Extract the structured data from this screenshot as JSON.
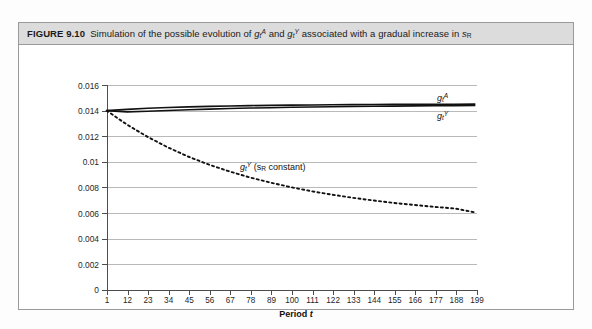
{
  "figure": {
    "label": "FIGURE 9.10",
    "caption_parts": {
      "before_a": "Simulation of the possible evolution of ",
      "g": "g",
      "t": "t",
      "supA": "A",
      "and": " and ",
      "supY": "Y",
      "after": " associated with a gradual increase in ",
      "s": "s",
      "subR": "R"
    },
    "caption_full": "Simulation of the possible evolution of g t A and g t Y associated with a gradual increase in s R"
  },
  "axes": {
    "y_ticks": [
      "0",
      "0.002",
      "0.004",
      "0.006",
      "0.008",
      "0.01",
      "0.012",
      "0.014",
      "0.016"
    ],
    "y_min": 0,
    "y_max": 0.016,
    "x_ticks": [
      "1",
      "12",
      "23",
      "34",
      "45",
      "56",
      "67",
      "78",
      "89",
      "100",
      "111",
      "122",
      "133",
      "144",
      "155",
      "166",
      "177",
      "188",
      "199"
    ],
    "x_min": 1,
    "x_max": 199,
    "x_title_text": "Period ",
    "x_title_var": "t"
  },
  "series_labels": {
    "ga": {
      "g": "g",
      "sub": "t",
      "sup": "A"
    },
    "gy": {
      "g": "g",
      "sub": "t",
      "sup": "Y"
    },
    "gy_const": {
      "g": "g",
      "sub": "t",
      "sup": "Y",
      "paren_open": " (s",
      "subR": "R",
      "paren_close": " constant)"
    }
  },
  "colors": {
    "caption_bar": "#dcdcdc",
    "border": "#9a9a9a",
    "axis": "#4d4d4d",
    "grid": "#b9b9b9",
    "curve": "#111111"
  },
  "chart_data": {
    "type": "line",
    "xlabel": "Period t",
    "ylabel": "",
    "xlim": [
      1,
      199
    ],
    "ylim": [
      0,
      0.016
    ],
    "grid": true,
    "legend": "inline-annotations",
    "x": [
      1,
      12,
      23,
      34,
      45,
      56,
      67,
      78,
      89,
      100,
      111,
      122,
      133,
      144,
      155,
      166,
      177,
      188,
      199
    ],
    "series": [
      {
        "name": "g_t^A",
        "style": "solid",
        "label_position": "right-top",
        "values": [
          0.014,
          0.0141,
          0.01418,
          0.01424,
          0.01429,
          0.01433,
          0.01436,
          0.01439,
          0.01441,
          0.01443,
          0.01444,
          0.01446,
          0.01447,
          0.01448,
          0.01449,
          0.01449,
          0.0145,
          0.0145,
          0.01451
        ]
      },
      {
        "name": "g_t^Y",
        "style": "solid",
        "label_position": "right-below",
        "values": [
          0.014,
          0.0139,
          0.01395,
          0.01401,
          0.01407,
          0.01412,
          0.01416,
          0.0142,
          0.01423,
          0.01426,
          0.01428,
          0.0143,
          0.01432,
          0.01434,
          0.01435,
          0.01437,
          0.01438,
          0.01439,
          0.0144
        ]
      },
      {
        "name": "g_t^Y (s_R constant)",
        "style": "dotted",
        "label_position": "center",
        "values": [
          0.014,
          0.0129,
          0.01195,
          0.01112,
          0.0104,
          0.00978,
          0.00925,
          0.00878,
          0.00838,
          0.00802,
          0.00771,
          0.00744,
          0.0072,
          0.00699,
          0.0068,
          0.00664,
          0.00649,
          0.00636,
          0.00605
        ]
      }
    ]
  }
}
